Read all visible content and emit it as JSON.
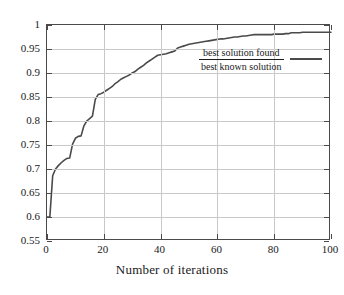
{
  "chart_data": {
    "type": "line",
    "title": "",
    "xlabel": "Number of iterations",
    "ylabel": "",
    "xlim": [
      0,
      100
    ],
    "ylim": [
      0.55,
      1
    ],
    "grid": true,
    "legend_position": "inside-right",
    "legend": [
      {
        "name": "best solution found / best known solution",
        "numerator": "best solution found",
        "denominator": "best known solution"
      }
    ],
    "xticks": [
      0,
      20,
      40,
      60,
      80,
      100
    ],
    "xtick_labels": [
      "0",
      "20",
      "40",
      "60",
      "80",
      "100"
    ],
    "yticks": [
      0.55,
      0.6,
      0.65,
      0.7,
      0.75,
      0.8,
      0.85,
      0.9,
      0.95,
      1
    ],
    "ytick_labels": [
      "0.55",
      "0.6",
      "0.65",
      "0.7",
      "0.75",
      "0.8",
      "0.85",
      "0.9",
      "0.95",
      "1"
    ],
    "series": [
      {
        "name": "best solution found / best known solution",
        "color": "#4a4a4a",
        "x": [
          0,
          1,
          2,
          3,
          4,
          5,
          6,
          7,
          8,
          9,
          10,
          11,
          12,
          13,
          14,
          15,
          16,
          17,
          18,
          19,
          20,
          21,
          22,
          23,
          24,
          25,
          26,
          27,
          28,
          29,
          30,
          31,
          32,
          33,
          34,
          35,
          36,
          37,
          38,
          39,
          40,
          41,
          42,
          43,
          44,
          45,
          46,
          47,
          48,
          49,
          50,
          51,
          52,
          53,
          54,
          55,
          56,
          57,
          58,
          59,
          60,
          61,
          62,
          63,
          64,
          65,
          66,
          67,
          68,
          69,
          70,
          71,
          72,
          73,
          74,
          75,
          76,
          77,
          78,
          79,
          80,
          81,
          82,
          83,
          84,
          85,
          86,
          87,
          88,
          89,
          90,
          91,
          92,
          93,
          94,
          95,
          96,
          97,
          98,
          99,
          100
        ],
        "y": [
          0.6,
          0.6,
          0.686,
          0.7,
          0.707,
          0.713,
          0.718,
          0.722,
          0.723,
          0.752,
          0.764,
          0.768,
          0.769,
          0.79,
          0.8,
          0.805,
          0.81,
          0.845,
          0.855,
          0.857,
          0.86,
          0.864,
          0.868,
          0.872,
          0.878,
          0.882,
          0.887,
          0.89,
          0.893,
          0.896,
          0.9,
          0.903,
          0.908,
          0.912,
          0.916,
          0.921,
          0.925,
          0.929,
          0.933,
          0.937,
          0.938,
          0.939,
          0.94,
          0.942,
          0.944,
          0.946,
          0.952,
          0.954,
          0.956,
          0.958,
          0.96,
          0.961,
          0.962,
          0.963,
          0.964,
          0.965,
          0.966,
          0.967,
          0.968,
          0.969,
          0.97,
          0.971,
          0.971,
          0.972,
          0.973,
          0.974,
          0.975,
          0.975,
          0.976,
          0.977,
          0.977,
          0.978,
          0.979,
          0.98,
          0.98,
          0.98,
          0.98,
          0.98,
          0.98,
          0.98,
          0.981,
          0.981,
          0.981,
          0.981,
          0.982,
          0.982,
          0.984,
          0.984,
          0.984,
          0.984,
          0.985,
          0.985,
          0.985,
          0.985,
          0.985,
          0.985,
          0.985,
          0.985,
          0.985,
          0.985,
          0.985
        ]
      }
    ]
  },
  "axis": {
    "x_title": "Number of iterations"
  },
  "colors": {
    "line": "#4a4a4a",
    "grid": "#c9c9c9",
    "frame": "#4a4a4a",
    "text": "#1a1a1a"
  }
}
